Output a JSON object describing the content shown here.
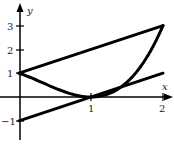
{
  "chart_data": {
    "type": "line",
    "title": "",
    "xlabel": "x",
    "ylabel": "y",
    "xlim": [
      0,
      2.1
    ],
    "ylim": [
      -1.6,
      3.6
    ],
    "grid": false,
    "legend": null,
    "x_ticks": [
      {
        "value": 1,
        "label": "1"
      },
      {
        "value": 2,
        "label": "2"
      }
    ],
    "y_ticks": [
      {
        "value": -1,
        "label": "−1"
      },
      {
        "value": 1,
        "label": "1"
      },
      {
        "value": 2,
        "label": "2"
      },
      {
        "value": 3,
        "label": "3"
      }
    ],
    "series": [
      {
        "name": "line-upper",
        "description": "y = x + 1",
        "x": [
          0,
          2
        ],
        "y": [
          1,
          3
        ]
      },
      {
        "name": "line-lower",
        "description": "y = x − 1",
        "x": [
          0,
          2
        ],
        "y": [
          -1,
          1
        ]
      },
      {
        "name": "curve",
        "description": "curve through (0,1), touching (1,0), ending (2,3)",
        "x": [
          0,
          0.25,
          0.5,
          0.75,
          1,
          1.25,
          1.5,
          1.75,
          2
        ],
        "y": [
          1,
          0.7,
          0.375,
          0.11,
          0,
          0.14,
          0.625,
          1.55,
          3
        ]
      }
    ],
    "colors": {
      "stroke": "#000000",
      "background": "#ffffff"
    }
  },
  "axes": {
    "x_label": "x",
    "y_label": "y",
    "x_tick_labels": [
      "1",
      "2"
    ],
    "y_tick_labels": [
      "3",
      "2",
      "1",
      "−1"
    ]
  }
}
